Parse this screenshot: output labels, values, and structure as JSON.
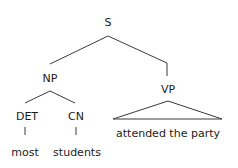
{
  "tree": {
    "root": {
      "label": "S"
    },
    "np": {
      "label": "NP"
    },
    "vp": {
      "label": "VP",
      "content": "attended the party"
    },
    "det": {
      "label": "DET",
      "word": "most"
    },
    "cn": {
      "label": "CN",
      "word": "students"
    }
  },
  "colors": {
    "line": "#3a3a3a",
    "text": "#1a1a1a"
  }
}
